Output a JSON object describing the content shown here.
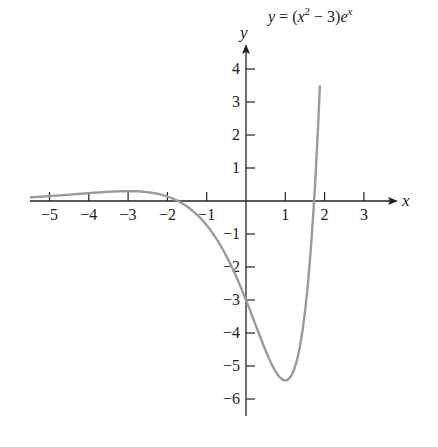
{
  "chart_data": {
    "type": "line",
    "title_parts": {
      "pre": "y = (x",
      "sup1": "2",
      "mid": " − 3)e",
      "sup2": "x"
    },
    "xlabel": "x",
    "ylabel": "y",
    "xlim": [
      -5.5,
      3.7
    ],
    "ylim": [
      -6.5,
      4.8
    ],
    "grid": false,
    "legend": "none",
    "x_ticks": [
      -5,
      -4,
      -3,
      -2,
      -1,
      1,
      2,
      3
    ],
    "x_tick_labels": [
      "−5",
      "−4",
      "−3",
      "−2",
      "−1",
      "1",
      "2",
      "3"
    ],
    "y_ticks": [
      4,
      3,
      2,
      1,
      -1,
      -2,
      -3,
      -4,
      -5,
      -6
    ],
    "y_tick_labels": [
      "4",
      "3",
      "2",
      "1",
      "−1",
      "−2",
      "−3",
      "−4",
      "−5",
      "−6"
    ],
    "series": [
      {
        "name": "y = (x^2 - 3)e^x",
        "color": "#9a9a9a",
        "x": [
          -5.5,
          -5,
          -4,
          -3,
          -2.5,
          -2,
          -1.5,
          -1,
          -0.5,
          0,
          0.5,
          0.75,
          1,
          1.25,
          1.5,
          1.6,
          1.732,
          1.8,
          1.88
        ],
        "y": [
          0.111,
          0.148,
          0.238,
          0.299,
          0.267,
          0.135,
          -0.167,
          -0.736,
          -1.668,
          -3.0,
          -4.534,
          -5.16,
          -5.437,
          -5.017,
          -3.361,
          -2.179,
          0.0,
          1.452,
          4.3
        ]
      }
    ],
    "annotations": [
      {
        "text": "y = (x^2 - 3)e^x",
        "near": [
          2.0,
          4.6
        ]
      }
    ]
  },
  "colors": {
    "axis": "#222222",
    "curve": "#9a9a9a"
  }
}
